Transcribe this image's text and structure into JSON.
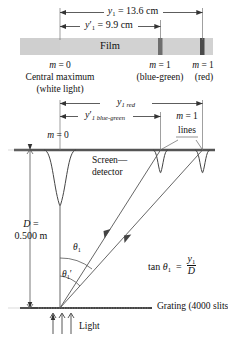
{
  "figure": {
    "colors": {
      "film_fill": "#d2d2d2",
      "film_edge": "#c0c0c0",
      "line_dark": "#3a3a3a",
      "line_thin": "#555555",
      "bar_blue_green": "#6e6e6e",
      "bar_red": "#4a4a4a",
      "screen_line": "#555555",
      "grating_line": "#444444"
    },
    "top_panel": {
      "dimension_upper": {
        "name": "y1-red-dimension",
        "symbol": "y",
        "subscript": "1",
        "prime": false,
        "value": "= 13.6 cm",
        "full_text": "y₁ = 13.6 cm"
      },
      "dimension_lower": {
        "name": "y1-prime-blue-green-dimension",
        "symbol": "y",
        "subscript": "1",
        "prime": true,
        "value": "= 9.9 cm",
        "full_text": "y′₁ = 9.9 cm"
      },
      "film_label": "Film",
      "marks": [
        {
          "order": "m = 0",
          "caption_line1": "Central maximum",
          "caption_line2": "(white light)"
        },
        {
          "order": "m = 1",
          "caption_line1": "(blue-green)",
          "caption_line2": ""
        },
        {
          "order": "m = 1",
          "caption_line1": "(red)",
          "caption_line2": ""
        }
      ]
    },
    "middle_panel": {
      "dimension_upper": {
        "name": "y1-red-screen-dimension",
        "symbol": "y",
        "subscript": "1 red",
        "prime": false
      },
      "dimension_lower": {
        "name": "y1-prime-blue-green-screen-dimension",
        "symbol": "y",
        "subscript": "1 blue-green",
        "prime": true
      },
      "m0_label": "m = 0",
      "m1_label": "m = 1",
      "m1_label_line2": "lines",
      "screen_label_line1": "Screen—",
      "screen_label_line2": "detector"
    },
    "lower_panel": {
      "distance_label_line1": "D =",
      "distance_label_line2": "0.500 m",
      "theta1": "θ",
      "theta1_sub": "1",
      "theta1_prime": "θ",
      "theta1_prime_sub": "1",
      "formula": {
        "lhs": "tan θ",
        "lhs_sub": "1",
        "equals": "=",
        "numerator": "y",
        "numerator_sub": "1",
        "denominator": "D"
      },
      "grating_label": "Grating (4000 slits/cm)",
      "light_label": "Light"
    }
  }
}
